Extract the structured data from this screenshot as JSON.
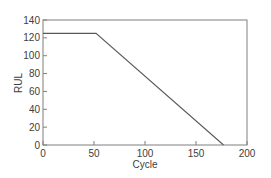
{
  "chart_data": {
    "type": "line",
    "title": "",
    "xlabel": "Cycle",
    "ylabel": "RUL",
    "xlim": [
      0,
      200
    ],
    "ylim": [
      0,
      140
    ],
    "xticks": [
      0,
      50,
      100,
      150,
      200
    ],
    "yticks": [
      0,
      20,
      40,
      60,
      80,
      100,
      120,
      140
    ],
    "grid": false,
    "legend": null,
    "series": [
      {
        "name": "RUL",
        "x": [
          0,
          52,
          177
        ],
        "y": [
          125,
          125,
          0
        ],
        "color": "#595959"
      }
    ]
  },
  "colors": {
    "axis": "#7f7f7f",
    "line": "#595959",
    "text": "#404040"
  }
}
